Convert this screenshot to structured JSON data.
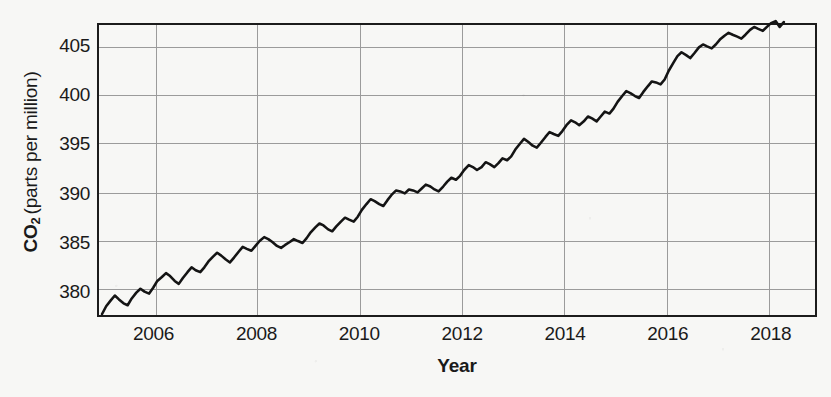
{
  "chart_data": {
    "type": "line",
    "title": "",
    "xlabel": "Year",
    "ylabel": "CO2 (parts per million)",
    "ylabel_prefix": "CO",
    "ylabel_sub": "2",
    "ylabel_rest": "(parts per million)",
    "xlim": [
      2004.9,
      2018.9
    ],
    "ylim": [
      377.4,
      407.2
    ],
    "xticks": [
      2006,
      2008,
      2010,
      2012,
      2014,
      2016,
      2018
    ],
    "xtick_labels": [
      "2006",
      "2008",
      "2010",
      "2012",
      "2014",
      "2016",
      "2018"
    ],
    "yticks": [
      380,
      385,
      390,
      395,
      400,
      405
    ],
    "ytick_labels": [
      "380",
      "385",
      "390",
      "395",
      "400",
      "405"
    ],
    "grid": true,
    "legend": "none",
    "line_color": "#141414",
    "grid_color": "#9a9a9a",
    "axis_color": "#1c1c1c",
    "background_color": "#f7f7f5",
    "series": [
      {
        "name": "Atmospheric CO2 (Mauna Loa monthly mean)",
        "x": [
          2004.96,
          2005.04,
          2005.13,
          2005.21,
          2005.29,
          2005.38,
          2005.46,
          2005.54,
          2005.63,
          2005.71,
          2005.79,
          2005.88,
          2005.96,
          2006.04,
          2006.13,
          2006.21,
          2006.29,
          2006.38,
          2006.46,
          2006.54,
          2006.63,
          2006.71,
          2006.79,
          2006.88,
          2006.96,
          2007.04,
          2007.13,
          2007.21,
          2007.29,
          2007.38,
          2007.46,
          2007.54,
          2007.63,
          2007.71,
          2007.79,
          2007.88,
          2007.96,
          2008.04,
          2008.13,
          2008.21,
          2008.29,
          2008.38,
          2008.46,
          2008.54,
          2008.63,
          2008.71,
          2008.79,
          2008.88,
          2008.96,
          2009.04,
          2009.13,
          2009.21,
          2009.29,
          2009.38,
          2009.46,
          2009.54,
          2009.63,
          2009.71,
          2009.79,
          2009.88,
          2009.96,
          2010.04,
          2010.13,
          2010.21,
          2010.29,
          2010.38,
          2010.46,
          2010.54,
          2010.63,
          2010.71,
          2010.79,
          2010.88,
          2010.96,
          2011.04,
          2011.13,
          2011.21,
          2011.29,
          2011.38,
          2011.46,
          2011.54,
          2011.63,
          2011.71,
          2011.79,
          2011.88,
          2011.96,
          2012.04,
          2012.13,
          2012.21,
          2012.29,
          2012.38,
          2012.46,
          2012.54,
          2012.63,
          2012.71,
          2012.79,
          2012.88,
          2012.96,
          2013.04,
          2013.13,
          2013.21,
          2013.29,
          2013.38,
          2013.46,
          2013.54,
          2013.63,
          2013.71,
          2013.79,
          2013.88,
          2013.96,
          2014.04,
          2014.13,
          2014.21,
          2014.29,
          2014.38,
          2014.46,
          2014.54,
          2014.63,
          2014.71,
          2014.79,
          2014.88,
          2014.96,
          2015.04,
          2015.13,
          2015.21,
          2015.29,
          2015.38,
          2015.46,
          2015.54,
          2015.63,
          2015.71,
          2015.79,
          2015.88,
          2015.96,
          2016.04,
          2016.13,
          2016.21,
          2016.29,
          2016.38,
          2016.46,
          2016.54,
          2016.63,
          2016.71,
          2016.79,
          2016.88,
          2016.96,
          2017.04,
          2017.13,
          2017.21,
          2017.29,
          2017.38,
          2017.46,
          2017.54,
          2017.63,
          2017.71,
          2017.79,
          2017.88,
          2017.96,
          2018.04,
          2018.13,
          2018.21,
          2018.29
        ],
        "y": [
          377.5,
          378.3,
          378.9,
          379.4,
          379.0,
          378.6,
          378.4,
          379.1,
          379.7,
          380.1,
          379.8,
          379.6,
          380.2,
          380.9,
          381.3,
          381.7,
          381.4,
          380.9,
          380.6,
          381.2,
          381.8,
          382.3,
          382.0,
          381.8,
          382.3,
          382.9,
          383.4,
          383.8,
          383.5,
          383.1,
          382.8,
          383.3,
          383.9,
          384.4,
          384.2,
          384.0,
          384.5,
          385.0,
          385.4,
          385.2,
          384.9,
          384.5,
          384.3,
          384.6,
          384.9,
          385.2,
          385.0,
          384.8,
          385.3,
          385.9,
          386.4,
          386.8,
          386.6,
          386.2,
          386.0,
          386.5,
          387.0,
          387.4,
          387.2,
          387.0,
          387.5,
          388.2,
          388.8,
          389.3,
          389.1,
          388.8,
          388.6,
          389.2,
          389.8,
          390.2,
          390.1,
          389.9,
          390.3,
          390.2,
          390.0,
          390.4,
          390.8,
          390.6,
          390.3,
          390.1,
          390.6,
          391.1,
          391.5,
          391.3,
          391.7,
          392.3,
          392.8,
          392.6,
          392.3,
          392.6,
          393.1,
          392.9,
          392.6,
          393.0,
          393.5,
          393.3,
          393.7,
          394.4,
          395.0,
          395.5,
          395.2,
          394.8,
          394.6,
          395.1,
          395.7,
          396.2,
          396.0,
          395.8,
          396.3,
          396.9,
          397.4,
          397.2,
          396.9,
          397.3,
          397.8,
          397.6,
          397.3,
          397.8,
          398.3,
          398.1,
          398.6,
          399.3,
          399.9,
          400.4,
          400.2,
          399.9,
          399.7,
          400.3,
          400.9,
          401.4,
          401.3,
          401.1,
          401.6,
          402.5,
          403.3,
          404.0,
          404.4,
          404.1,
          403.8,
          404.3,
          404.9,
          405.2,
          405.0,
          404.8,
          405.2,
          405.7,
          406.1,
          406.4,
          406.2,
          406.0,
          405.8,
          406.2,
          406.7,
          407.0,
          406.8,
          406.6,
          407.0,
          407.4,
          407.6,
          407.0,
          407.5
        ]
      }
    ]
  }
}
